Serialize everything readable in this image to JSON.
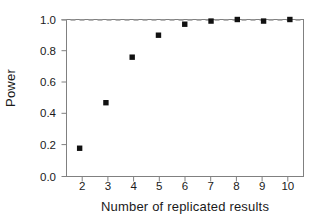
{
  "chart_data": {
    "type": "scatter",
    "title": "",
    "xlabel": "Number of replicated results",
    "ylabel": "Power",
    "x": [
      2,
      3,
      4,
      5,
      6,
      7,
      8,
      9,
      10
    ],
    "values": [
      0.18,
      0.47,
      0.76,
      0.9,
      0.97,
      0.99,
      1.0,
      0.99,
      1.0
    ],
    "series": [
      {
        "name": "Power",
        "marker": "square",
        "color": "#111111",
        "values": [
          0.18,
          0.47,
          0.76,
          0.9,
          0.97,
          0.99,
          1.0,
          0.99,
          1.0
        ]
      }
    ],
    "xlim": [
      1.5,
      10.5
    ],
    "ylim": [
      0.0,
      1.0
    ],
    "xticks": [
      2,
      3,
      4,
      5,
      6,
      7,
      8,
      9,
      10
    ],
    "xtick_labels": [
      "2",
      "3",
      "4",
      "5",
      "6",
      "7",
      "8",
      "9",
      "10"
    ],
    "yticks": [
      0.0,
      0.2,
      0.4,
      0.6,
      0.8,
      1.0
    ],
    "ytick_labels": [
      "0.0",
      "0.2",
      "0.4",
      "0.6",
      "0.8",
      "1.0"
    ],
    "grid": false,
    "legend": null,
    "legend_position": "none",
    "annotations": [
      {
        "type": "reference-line",
        "orientation": "horizontal",
        "value": 1.0,
        "style": "dashed",
        "color": "#9a9a9a",
        "label": ""
      }
    ],
    "frame": {
      "visible": true,
      "color": "#808080",
      "sides": [
        "top",
        "right",
        "bottom",
        "left"
      ]
    },
    "background_color": "#ffffff",
    "marker_color": "#111111",
    "axis_color": "#808080",
    "text_color": "#1a1a1a"
  }
}
